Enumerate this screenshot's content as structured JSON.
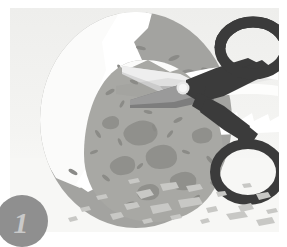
{
  "panel": {
    "name": "step-illustration-panel",
    "alt_description": "Illustration: a pair of scissors snipping open the top of a large speckled gray egg, with a second egg behind it and shell fragments scattered below",
    "background_top_color": "#f2f2f0",
    "background_bottom_color": "#fbfbfa",
    "ground_color": "#f6f6f4"
  },
  "step_badge": {
    "label": "1",
    "circle_color": "#8f8f8f",
    "text_color": "#c9c9c9"
  },
  "objects": {
    "back_egg": {
      "name": "back-egg",
      "fill": "#a3a3a0",
      "speck_fill": "#8a8a87"
    },
    "front_egg": {
      "name": "front-egg",
      "fill": "#a8a8a4",
      "blotch_fill": "#90908c",
      "speck_fill": "#8b8b87"
    },
    "shell_crack": {
      "name": "cracked-shell-opening",
      "fill": "#ffffff",
      "shadow_fill": "#e4e4e2"
    },
    "scissors": {
      "name": "scissors",
      "handle_fill": "#3b3b3b",
      "blade_fill": "#6e6e6e",
      "blade_highlight": "#d6d6d6",
      "pivot_fill": "#e8e8e8"
    },
    "shell_fragments": {
      "name": "shell-fragments",
      "fill": "#c8c8c5",
      "count": 22
    }
  }
}
